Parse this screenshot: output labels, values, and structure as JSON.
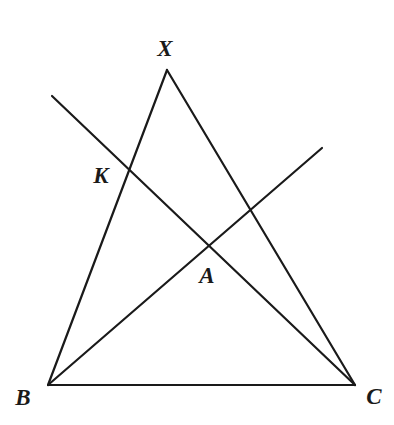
{
  "figure": {
    "background_color": "#ffffff",
    "stroke_color": "#1a1a1a",
    "stroke_width": 2.2,
    "width": 394,
    "height": 425
  },
  "labels": {
    "x": "X",
    "k": "K",
    "a": "A",
    "b": "B",
    "c": "C"
  },
  "chart_data": {
    "type": "diagram",
    "xlim": [
      0,
      394
    ],
    "ylim": [
      425,
      0
    ],
    "grid": false,
    "legend": null,
    "points": [
      {
        "name": "X",
        "x": 167,
        "y": 70,
        "label": "X",
        "label_x": 165,
        "label_y": 48,
        "role": "apex-vertex"
      },
      {
        "name": "B",
        "x": 48,
        "y": 385,
        "label": "B",
        "label_x": 23,
        "label_y": 397,
        "role": "base-vertex-left"
      },
      {
        "name": "C",
        "x": 355,
        "y": 385,
        "label": "C",
        "label_x": 374,
        "label_y": 396,
        "role": "base-vertex-right"
      },
      {
        "name": "K",
        "x": 127,
        "y": 170,
        "label": "K",
        "label_x": 101,
        "label_y": 175,
        "role": "intersection"
      },
      {
        "name": "A",
        "x": 208,
        "y": 245,
        "label": "A",
        "label_x": 207,
        "label_y": 275,
        "role": "intersection"
      },
      {
        "name": "P",
        "x": 52,
        "y": 96,
        "label": "",
        "role": "ray-endpoint-upper-left"
      },
      {
        "name": "Q",
        "x": 322,
        "y": 148,
        "label": "",
        "role": "ray-endpoint-upper-right"
      },
      {
        "name": "R",
        "x": 250,
        "y": 208,
        "label": "",
        "role": "unlabeled-crossing"
      }
    ],
    "segments": [
      {
        "name": "side-XB",
        "from": [
          167,
          70
        ],
        "to": [
          48,
          385
        ],
        "description": "left side of triangle from apex X to vertex B"
      },
      {
        "name": "side-XC",
        "from": [
          167,
          70
        ],
        "to": [
          355,
          385
        ],
        "description": "right side of triangle from apex X to vertex C"
      },
      {
        "name": "side-BC",
        "from": [
          48,
          385
        ],
        "to": [
          355,
          385
        ],
        "description": "base of triangle from B to C"
      },
      {
        "name": "line-through-K",
        "from": [
          52,
          96
        ],
        "to": [
          355,
          385
        ],
        "description": "line from upper-left through K down to C"
      },
      {
        "name": "ray-through-A",
        "from": [
          48,
          385
        ],
        "to": [
          322,
          148
        ],
        "description": "ray from B through A to upper right"
      }
    ]
  }
}
